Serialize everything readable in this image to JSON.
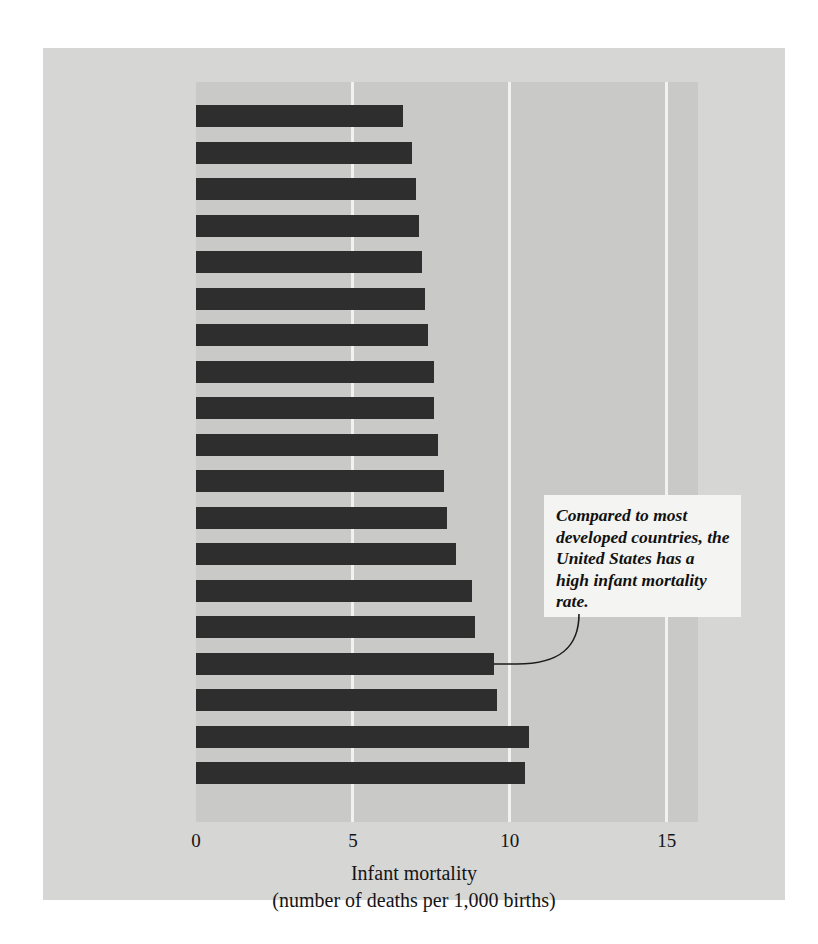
{
  "figure": {
    "background_color": "#d6d6d4",
    "plot_band_color": "#c9c9c7",
    "bar_color": "#2e2e2e",
    "gridline_color": "#f2f2f0"
  },
  "annotation": {
    "text": "Compared to most developed countries, the United States has a high infant mortality rate.",
    "box_color": "#f4f4f2",
    "leader_target": "United States"
  },
  "chart_data": {
    "type": "bar",
    "orientation": "horizontal",
    "title": "",
    "xlabel_line1": "Infant mortality",
    "xlabel_line2": "(number of deaths per 1,000 births)",
    "ylabel": "",
    "xlim": [
      0,
      16
    ],
    "xticks": [
      0,
      5,
      10,
      15
    ],
    "xticklabels": [
      "0",
      "5",
      "10",
      "15"
    ],
    "grid": true,
    "grid_axis": "x",
    "legend": false,
    "categories": [
      "Canada",
      "Netherlands",
      "Switzerland",
      "Germany",
      "Australia",
      "France",
      "Great Britain",
      "Denmark",
      "Austria",
      "Spain",
      "Ireland",
      "Greece",
      "New Zealand",
      "Italy",
      "Belgium",
      "United States",
      "Israel",
      "Portugal",
      "Cuba"
    ],
    "values": [
      6.6,
      6.9,
      7.0,
      7.1,
      7.2,
      7.3,
      7.4,
      7.6,
      7.6,
      7.7,
      7.9,
      8.0,
      8.3,
      8.8,
      8.9,
      9.5,
      9.6,
      10.6,
      10.5
    ]
  }
}
